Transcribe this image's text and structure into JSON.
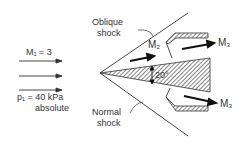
{
  "diagram": {
    "inlet_mach": "M₁ = 3",
    "inlet_pressure": "p₁ = 40 kPa",
    "inlet_pressure_note": "absolute",
    "oblique_shock_line1": "Oblique",
    "oblique_shock_line2": "shock",
    "normal_shock_line1": "Normal",
    "normal_shock_line2": "shock",
    "mach2": "M₂",
    "mach3_upper": "M₃",
    "mach3_lower": "M₃",
    "wedge_angle": "20°"
  }
}
